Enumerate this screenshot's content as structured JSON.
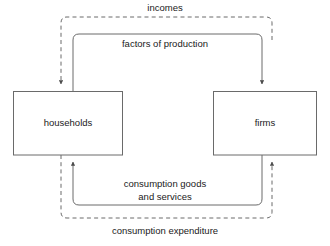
{
  "diagram": {
    "nodes": [
      {
        "id": "households",
        "label": "households"
      },
      {
        "id": "firms",
        "label": "firms"
      }
    ],
    "flows": [
      {
        "id": "incomes",
        "label": "incomes",
        "style": "dashed",
        "from": "firms",
        "to": "households",
        "position": "outer-top",
        "arrow": "down-into-households"
      },
      {
        "id": "factors-of-production",
        "label": "factors of production",
        "style": "solid",
        "from": "households",
        "to": "firms",
        "position": "inner-top",
        "arrow": "down-into-firms"
      },
      {
        "id": "consumption-goods-and-services",
        "label": "consumption goods\nand services",
        "label_line1": "consumption goods",
        "label_line2": "and services",
        "style": "solid",
        "from": "firms",
        "to": "households",
        "position": "inner-bottom",
        "arrow": "up-into-households"
      },
      {
        "id": "consumption-expenditure",
        "label": "consumption expenditure",
        "style": "dashed",
        "from": "households",
        "to": "firms",
        "position": "outer-bottom",
        "arrow": "up-into-firms"
      }
    ],
    "colors": {
      "background": "#ffffff",
      "stroke": "#555555",
      "box_stroke": "#666666",
      "text": "#1a1a1a"
    }
  }
}
